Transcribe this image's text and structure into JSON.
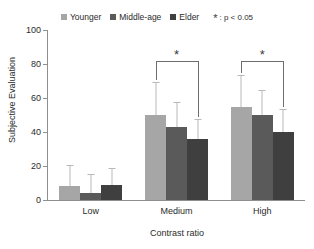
{
  "chart_data": {
    "type": "bar",
    "title": "",
    "xlabel": "Contrast ratio",
    "ylabel": "Subjective Evaluation",
    "categories": [
      "Low",
      "Medium",
      "High"
    ],
    "ylim": [
      0,
      100
    ],
    "yticks": [
      0,
      20,
      40,
      60,
      80,
      100
    ],
    "grid": false,
    "legend_position": "top-center",
    "series": [
      {
        "name": "Younger",
        "color": "#a6a6a6",
        "values": [
          8,
          50,
          55
        ],
        "errors_upper": [
          12,
          19,
          18
        ]
      },
      {
        "name": "Middle-age",
        "color": "#5a5a5a",
        "values": [
          4,
          43,
          50
        ],
        "errors_upper": [
          11,
          14,
          14
        ]
      },
      {
        "name": "Elder",
        "color": "#3f3f3f",
        "values": [
          9,
          36,
          40
        ],
        "errors_upper": [
          9,
          11,
          13
        ]
      }
    ],
    "annotations": [
      {
        "group": "Medium",
        "from": "Younger",
        "to": "Elder",
        "marker": "*",
        "top_value": 82
      },
      {
        "group": "High",
        "from": "Younger",
        "to": "Elder",
        "marker": "*",
        "top_value": 82
      }
    ],
    "significance_note": ": p < 0.05",
    "significance_marker": "*"
  },
  "legend": {
    "entries": [
      {
        "label": "Younger"
      },
      {
        "label": "Middle-age"
      },
      {
        "label": "Elder"
      }
    ]
  }
}
